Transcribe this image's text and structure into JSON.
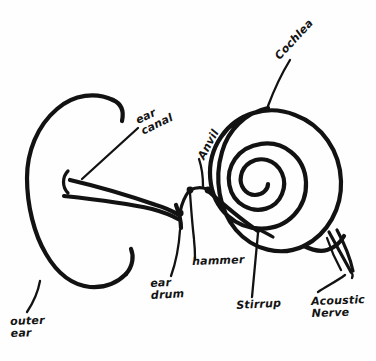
{
  "diagram": {
    "style": "hand-drawn pen sketch",
    "background_color": "#fefefe",
    "ink_color": "#121212",
    "canvas": {
      "width": 376,
      "height": 361
    }
  },
  "labels": [
    {
      "id": "outer-ear",
      "text": "outer\near",
      "lines": [
        "outer",
        "ear"
      ],
      "part": "pinna / auricle",
      "rotation_deg": -2
    },
    {
      "id": "ear-canal",
      "text": "ear\ncanal",
      "lines": [
        "ear",
        "canal"
      ],
      "part": "external auditory canal",
      "rotation_deg": -26
    },
    {
      "id": "anvil",
      "text": "Anvil",
      "lines": [
        "Anvil"
      ],
      "part": "incus",
      "rotation_deg": -62
    },
    {
      "id": "cochlea",
      "text": "Cochlea",
      "lines": [
        "Cochlea"
      ],
      "part": "cochlea spiral",
      "rotation_deg": -47
    },
    {
      "id": "ear-drum",
      "text": "ear\ndrum",
      "lines": [
        "ear",
        "drum"
      ],
      "part": "tympanic membrane",
      "rotation_deg": -3
    },
    {
      "id": "hammer",
      "text": "hammer",
      "lines": [
        "hammer"
      ],
      "part": "malleus",
      "rotation_deg": -2
    },
    {
      "id": "stirrup",
      "text": "Stirrup",
      "lines": [
        "Stirrup"
      ],
      "part": "stapes",
      "rotation_deg": -3
    },
    {
      "id": "acoustic-nerve",
      "text": "Acoustic\nNerve",
      "lines": [
        "Acoustic",
        "Nerve"
      ],
      "part": "vestibulocochlear nerve",
      "rotation_deg": -2
    }
  ]
}
